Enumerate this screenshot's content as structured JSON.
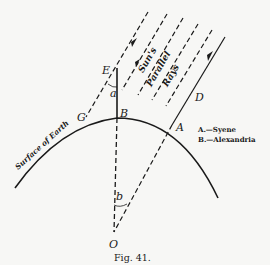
{
  "figure": {
    "caption": "Fig. 41.",
    "points": {
      "E": "E",
      "G": "G",
      "B": "B",
      "A": "A",
      "D": "D",
      "O": "O"
    },
    "angles": {
      "a": "a",
      "b": "b"
    },
    "rays_label": [
      "Sun's",
      "Parallel",
      "Rays"
    ],
    "surface_label": "Surface of Earth",
    "legend": [
      {
        "key": "A",
        "text": "A.—Syene"
      },
      {
        "key": "B",
        "text": "B.—Alexandria"
      }
    ]
  },
  "colors": {
    "ink": "#1a1a1a",
    "paper": "#f7f7f5"
  }
}
